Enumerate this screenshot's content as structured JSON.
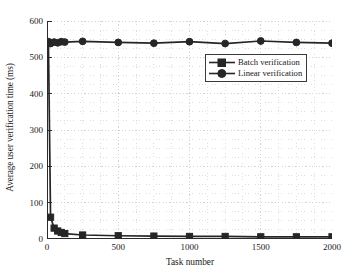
{
  "chart_data": {
    "type": "line",
    "title": "",
    "xlabel": "Task number",
    "ylabel": "Average user verification time (ms)",
    "xlim": [
      0,
      2000
    ],
    "ylim": [
      0,
      600
    ],
    "xticks": [
      0,
      500,
      1000,
      1500,
      2000
    ],
    "yticks": [
      0,
      100,
      200,
      300,
      400,
      500,
      600
    ],
    "xtick_labels": [
      "0",
      "500",
      "1000",
      "1500",
      "2000"
    ],
    "ytick_labels": [
      "0",
      "100",
      "200",
      "300",
      "400",
      "500",
      "600"
    ],
    "grid": true,
    "grid_style": "dotted",
    "grid_color": "#c8c8c8",
    "legend_position": "upper-right-inside",
    "series": [
      {
        "name": "Batch verification",
        "marker": "square",
        "color": "#262626",
        "x": [
          10,
          25,
          50,
          75,
          100,
          125,
          250,
          500,
          750,
          1000,
          1250,
          1500,
          1750,
          2000
        ],
        "values": [
          540,
          60,
          30,
          22,
          18,
          15,
          11,
          9,
          8,
          7,
          7,
          6,
          6,
          6
        ]
      },
      {
        "name": "Linear verification",
        "marker": "circle",
        "color": "#262626",
        "x": [
          10,
          25,
          50,
          75,
          100,
          125,
          250,
          500,
          750,
          1000,
          1250,
          1500,
          1750,
          2000
        ],
        "values": [
          543,
          538,
          542,
          540,
          543,
          542,
          544,
          541,
          539,
          543,
          538,
          545,
          541,
          539
        ]
      }
    ]
  },
  "legend": {
    "items": [
      {
        "label": "Batch verification",
        "marker": "square"
      },
      {
        "label": "Linear verification",
        "marker": "circle"
      }
    ]
  }
}
